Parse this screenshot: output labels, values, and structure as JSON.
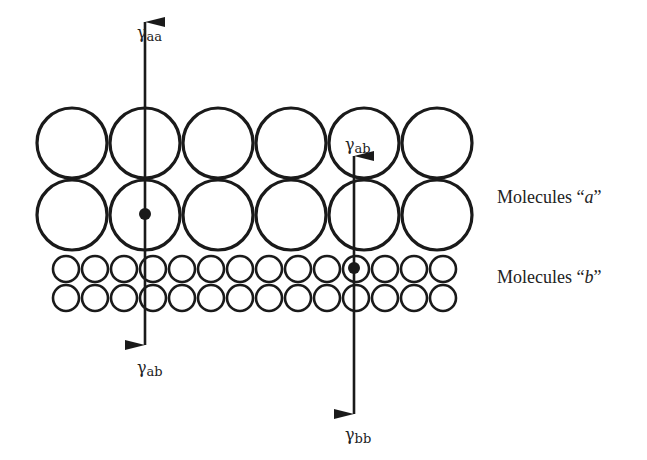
{
  "diagram": {
    "colors": {
      "stroke": "#1a1a1a",
      "background": "#ffffff"
    },
    "large_molecules": {
      "rows": 2,
      "cols": 6,
      "x0": 72,
      "dx": 73,
      "y0": 143,
      "dy": 72,
      "r": 35
    },
    "small_molecules": {
      "rows": 2,
      "cols": 14,
      "x0": 66,
      "dx": 29,
      "y0": 269,
      "dy": 29,
      "r": 13
    },
    "arrows": [
      {
        "name": "arrow-left",
        "x": 145,
        "y_top": 22,
        "y_bottom": 345,
        "dot": {
          "x": 145,
          "y": 214
        },
        "label_top": {
          "base": "γ",
          "sub": "aa",
          "x": 137,
          "y": 38
        },
        "label_bottom": {
          "base": "γ",
          "sub": "ab",
          "x": 137,
          "y": 373
        }
      },
      {
        "name": "arrow-right",
        "x": 354,
        "y_top": 156,
        "y_bottom": 414,
        "dot": {
          "x": 354,
          "y": 268
        },
        "label_top": {
          "base": "γ",
          "sub": "ab",
          "x": 345,
          "y": 150
        },
        "label_bottom": {
          "base": "γ",
          "sub": "bb",
          "x": 345,
          "y": 440
        }
      }
    ],
    "labels": {
      "molecules_a": {
        "prefix": "Molecules “",
        "var": "a",
        "suffix": "”"
      },
      "molecules_b": {
        "prefix": "Molecules “",
        "var": "b",
        "suffix": "”"
      }
    }
  }
}
